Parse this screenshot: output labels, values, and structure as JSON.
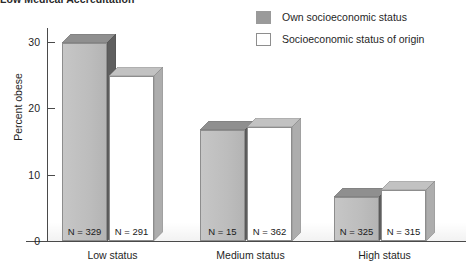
{
  "header": {
    "cropped_title": "Low Medical Accreditation"
  },
  "legend": {
    "position": "top-right",
    "items": [
      {
        "label": "Own socioeconomic status",
        "swatch": "own",
        "color": "#9a9a9a"
      },
      {
        "label": "Socioeconomic status of origin",
        "swatch": "origin",
        "color": "#ffffff"
      }
    ]
  },
  "axes": {
    "ylabel": "Percent obese",
    "yticks": [
      "0",
      "10",
      "20",
      "30"
    ]
  },
  "chart_data": {
    "type": "bar",
    "title": "",
    "xlabel": "",
    "ylabel": "Percent obese",
    "ylim": [
      0,
      32
    ],
    "yticks": [
      0,
      10,
      20,
      30
    ],
    "grid": false,
    "legend_position": "top-right",
    "categories": [
      "Low status",
      "Medium status",
      "High status"
    ],
    "series": [
      {
        "name": "Own socioeconomic status",
        "color": "#bdbdbd",
        "values": [
          29.9,
          16.7,
          6.6
        ],
        "n_labels": [
          "N = 329",
          "N = 15",
          "N = 325"
        ]
      },
      {
        "name": "Socioeconomic status of origin",
        "color": "#ffffff",
        "values": [
          24.8,
          17.2,
          7.7
        ],
        "n_labels": [
          "N = 291",
          "N = 362",
          "N = 315"
        ]
      }
    ]
  }
}
